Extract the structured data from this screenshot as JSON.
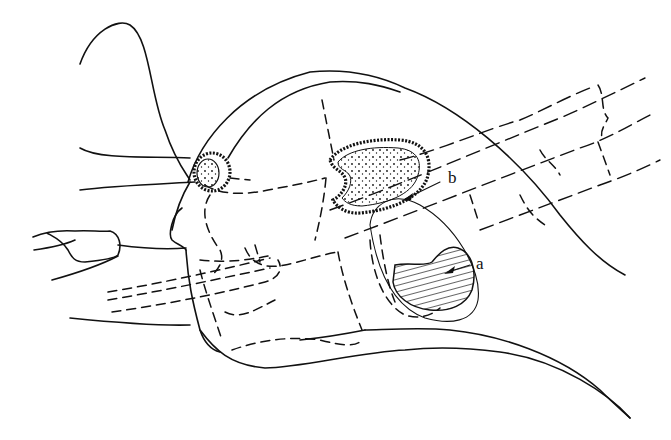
{
  "figure": {
    "labels": [
      {
        "id": "a",
        "text": "a",
        "points_to": "hatched region (lower oval)"
      },
      {
        "id": "b",
        "text": "b",
        "points_to": "stippled region (upper ovoid)"
      }
    ],
    "colors": {
      "ink": "#111111",
      "background": "#ffffff"
    }
  }
}
